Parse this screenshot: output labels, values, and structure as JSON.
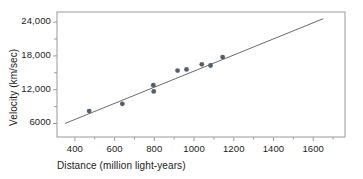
{
  "chart_data": {
    "type": "scatter",
    "title": "",
    "xlabel": "Distance (million light-years)",
    "ylabel": "Velocity (km/sec)",
    "xlim": [
      310,
      1760
    ],
    "ylim": [
      3600,
      25800
    ],
    "xticks": [
      400,
      600,
      800,
      1000,
      1200,
      1400,
      1600
    ],
    "xtick_labels": [
      "400",
      "600",
      "800",
      "1000",
      "1200",
      "1400",
      "1600"
    ],
    "yticks": [
      6000,
      12000,
      18000,
      24000
    ],
    "ytick_labels": [
      "6000",
      "12,000",
      "18,000",
      "24,000"
    ],
    "minor_yticks": [
      9000,
      15000,
      21000
    ],
    "grid": false,
    "legend": false,
    "marker_color": "#555f6b",
    "line_color": "#6b6b6b",
    "frame_color": "#9a9a9a",
    "points": [
      {
        "x": 472,
        "y": 8200
      },
      {
        "x": 639,
        "y": 9500
      },
      {
        "x": 795,
        "y": 12800
      },
      {
        "x": 797,
        "y": 11700
      },
      {
        "x": 917,
        "y": 15400
      },
      {
        "x": 962,
        "y": 15600
      },
      {
        "x": 1039,
        "y": 16500
      },
      {
        "x": 1083,
        "y": 16300
      },
      {
        "x": 1144,
        "y": 17800
      }
    ],
    "fit_line": {
      "x1": 350,
      "y1": 6000,
      "x2": 1650,
      "y2": 24600,
      "slope": 14.3,
      "intercept": 995
    }
  }
}
